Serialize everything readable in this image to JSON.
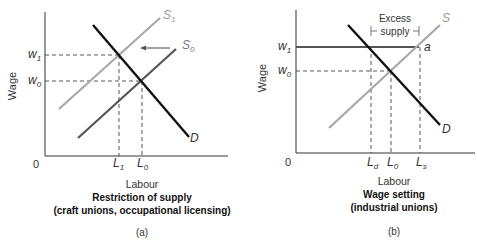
{
  "panels": [
    {
      "id": "a",
      "y_axis_label": "Wage",
      "x_axis_label": "Labour",
      "origin_label": "0",
      "title": "Restriction of supply",
      "subtitle": "(craft unions, occupational licensing)",
      "panel_label": "(a)",
      "wage_labels": {
        "w1": "w",
        "w1_sub": "1",
        "w0": "w",
        "w0_sub": "0"
      },
      "labour_labels": {
        "L1": "L",
        "L1_sub": "1",
        "L0": "L",
        "L0_sub": "0"
      },
      "curves": {
        "S1": "S",
        "S1_sub": "1",
        "S0": "S",
        "S0_sub": "0",
        "D": "D"
      }
    },
    {
      "id": "b",
      "y_axis_label": "Wage",
      "x_axis_label": "Labour",
      "origin_label": "0",
      "title": "Wage setting",
      "subtitle": "(industrial unions)",
      "panel_label": "(b)",
      "wage_labels": {
        "w1": "w",
        "w1_sub": "1",
        "w0": "w",
        "w0_sub": "0"
      },
      "labour_labels": {
        "Ld": "L",
        "Ld_sub": "d",
        "L0": "L",
        "L0_sub": "0",
        "Ls": "L",
        "Ls_sub": "s"
      },
      "curves": {
        "S": "S",
        "D": "D"
      },
      "point_label": "a",
      "annotation_line1": "Excess",
      "annotation_line2": "supply"
    }
  ],
  "colors": {
    "demand": "#111111",
    "supply_original": "#555555",
    "supply_shifted": "#a8a8a8",
    "axis": "#333333",
    "guide": "#444444",
    "wage_floor": "#555555"
  }
}
